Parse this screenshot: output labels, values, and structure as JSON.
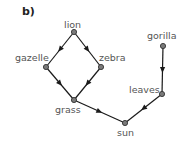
{
  "panel_label": "b)",
  "colors": {
    "edge": "#1a1a1a",
    "node_fill": "#7a7a7a",
    "node_stroke": "#333333",
    "label_text": "#555555"
  },
  "nodes": [
    {
      "id": "lion",
      "label": "lion",
      "x": 74,
      "y": 32
    },
    {
      "id": "gazelle",
      "label": "gazelle",
      "x": 46,
      "y": 67
    },
    {
      "id": "zebra",
      "label": "zebra",
      "x": 101,
      "y": 67
    },
    {
      "id": "grass",
      "label": "grass",
      "x": 74,
      "y": 100
    },
    {
      "id": "sun",
      "label": "sun",
      "x": 125,
      "y": 123
    },
    {
      "id": "gorilla",
      "label": "gorilla",
      "x": 163,
      "y": 46
    },
    {
      "id": "leaves",
      "label": "leaves",
      "x": 162,
      "y": 94
    }
  ],
  "edges": [
    {
      "from": "lion",
      "to": "gazelle"
    },
    {
      "from": "lion",
      "to": "zebra"
    },
    {
      "from": "gazelle",
      "to": "grass"
    },
    {
      "from": "zebra",
      "to": "grass"
    },
    {
      "from": "grass",
      "to": "sun"
    },
    {
      "from": "gorilla",
      "to": "leaves"
    },
    {
      "from": "leaves",
      "to": "sun"
    }
  ]
}
